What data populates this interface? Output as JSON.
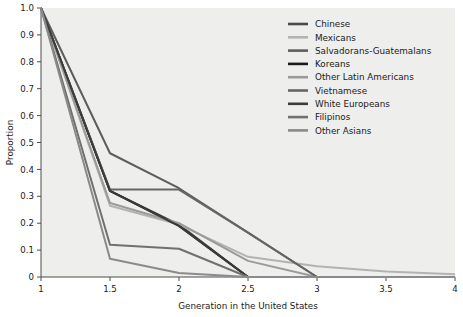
{
  "chart_data": {
    "type": "line",
    "title": "",
    "xlabel": "Generation in the United States",
    "ylabel": "Proportion",
    "xlim": [
      1,
      4
    ],
    "ylim": [
      0,
      1.0
    ],
    "grid": false,
    "legend_position": "top-right-inside",
    "x_ticks": [
      "1",
      "1.5",
      "2",
      "2.5",
      "3",
      "3.5",
      "4"
    ],
    "x_tick_values": [
      1,
      1.5,
      2,
      2.5,
      3,
      3.5,
      4
    ],
    "y_ticks": [
      "0",
      "0.1",
      "0.2",
      "0.3",
      "0.4",
      "0.5",
      "0.6",
      "0.7",
      "0.8",
      "0.9",
      "1.0"
    ],
    "y_tick_values": [
      0,
      0.1,
      0.2,
      0.3,
      0.4,
      0.5,
      0.6,
      0.7,
      0.8,
      0.9,
      1.0
    ],
    "x": [
      1,
      1.5,
      2,
      2.5,
      3,
      3.5,
      4
    ],
    "series": [
      {
        "name": "Chinese",
        "color": "#4a4a4a",
        "values": [
          1.0,
          0.32,
          0.195,
          0.0,
          0.0,
          0.0,
          0.0
        ]
      },
      {
        "name": "Mexicans",
        "color": "#b3b3b3",
        "values": [
          1.0,
          0.265,
          0.195,
          0.075,
          0.04,
          0.02,
          0.01
        ]
      },
      {
        "name": "Salvadorans-Guatemalans",
        "color": "#5d5d5d",
        "values": [
          1.0,
          0.46,
          0.33,
          0.165,
          0.0,
          0.0,
          0.0
        ]
      },
      {
        "name": "Koreans",
        "color": "#1a1a1a",
        "values": [
          1.0,
          0.32,
          0.19,
          0.0,
          0.0,
          0.0,
          0.0
        ]
      },
      {
        "name": "Other Latin Americans",
        "color": "#9a9a9a",
        "values": [
          1.0,
          0.275,
          0.2,
          0.06,
          0.0,
          0.0,
          0.0
        ]
      },
      {
        "name": "Vietnamese",
        "color": "#666666",
        "values": [
          1.0,
          0.325,
          0.325,
          0.165,
          0.0,
          0.0,
          0.0
        ]
      },
      {
        "name": "White Europeans",
        "color": "#3c3c3c",
        "values": [
          1.0,
          0.32,
          0.19,
          0.0,
          0.0,
          0.0,
          0.0
        ]
      },
      {
        "name": "Filipinos",
        "color": "#707070",
        "values": [
          1.0,
          0.12,
          0.105,
          0.0,
          0.0,
          0.0,
          0.0
        ]
      },
      {
        "name": "Other Asians",
        "color": "#8a8a8a",
        "values": [
          1.0,
          0.068,
          0.015,
          0.0,
          0.0,
          0.0,
          0.0
        ]
      }
    ]
  },
  "style": {
    "plot_background": "#eeeeec",
    "figure_background": "#ffffff",
    "axis_color": "#4d4d4d",
    "text_color": "#1a1a1a"
  }
}
